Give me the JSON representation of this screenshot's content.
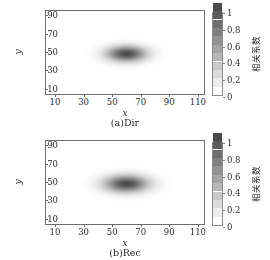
{
  "figure": {
    "background": "#ffffff",
    "axis_color": "#6d6d6d",
    "text_color": "#2b2b2b"
  },
  "panels": [
    {
      "id": "panel-a",
      "caption": "(a)Dir",
      "xlabel": "x",
      "ylabel": "y",
      "xticks": [
        "10",
        "30",
        "50",
        "70",
        "90",
        "110"
      ],
      "yticks": [
        "10",
        "30",
        "50",
        "70",
        "90"
      ],
      "colorbar": {
        "title": "相关系数",
        "ticks": [
          "1",
          "0.8",
          "0.6",
          "0.4",
          "0.2",
          "0"
        ],
        "min_color": "#ffffff",
        "max_color": "#4a4a4a"
      }
    },
    {
      "id": "panel-b",
      "caption": "(b)Rec",
      "xlabel": "x",
      "ylabel": "y",
      "xticks": [
        "10",
        "30",
        "50",
        "70",
        "90",
        "110"
      ],
      "yticks": [
        "10",
        "30",
        "50",
        "70",
        "90"
      ],
      "colorbar": {
        "title": "相关系数",
        "ticks": [
          "1",
          "0.8",
          "0.6",
          "0.4",
          "0.2",
          "0"
        ],
        "min_color": "#ffffff",
        "max_color": "#4a4a4a"
      }
    }
  ],
  "chart_data": [
    {
      "type": "heatmap",
      "title": "(a)Dir",
      "xlabel": "x",
      "ylabel": "y",
      "xlim": [
        3,
        115
      ],
      "ylim": [
        3,
        96
      ],
      "xticks": [
        10,
        30,
        50,
        70,
        90,
        110
      ],
      "yticks": [
        10,
        30,
        50,
        70,
        90
      ],
      "zlim": [
        0,
        1
      ],
      "zlabel": "相关系数",
      "colormap": "grayscale_inverted",
      "grid": false,
      "legend": "colorbar-right",
      "field": {
        "description": "elliptical gaussian correlation peak",
        "peak_value": 1.0,
        "center_x": 60,
        "center_y": 48,
        "sigma_x": 9.5,
        "sigma_y": 6.0,
        "background_value": 0.0
      },
      "contour_levels": [
        0.1,
        0.2,
        0.3,
        0.4,
        0.5,
        0.6,
        0.7,
        0.8,
        0.9,
        1.0
      ]
    },
    {
      "type": "heatmap",
      "title": "(b)Rec",
      "xlabel": "x",
      "ylabel": "y",
      "xlim": [
        3,
        115
      ],
      "ylim": [
        3,
        96
      ],
      "xticks": [
        10,
        30,
        50,
        70,
        90,
        110
      ],
      "yticks": [
        10,
        30,
        50,
        70,
        90
      ],
      "zlim": [
        0,
        1
      ],
      "zlabel": "相关系数",
      "colormap": "grayscale_inverted",
      "grid": false,
      "legend": "colorbar-right",
      "field": {
        "description": "elliptical gaussian correlation peak, slightly broader",
        "peak_value": 1.0,
        "center_x": 60,
        "center_y": 48,
        "sigma_x": 10.5,
        "sigma_y": 6.5,
        "background_value": 0.0
      },
      "contour_levels": [
        0.1,
        0.2,
        0.3,
        0.4,
        0.5,
        0.6,
        0.7,
        0.8,
        0.9,
        1.0
      ]
    }
  ]
}
